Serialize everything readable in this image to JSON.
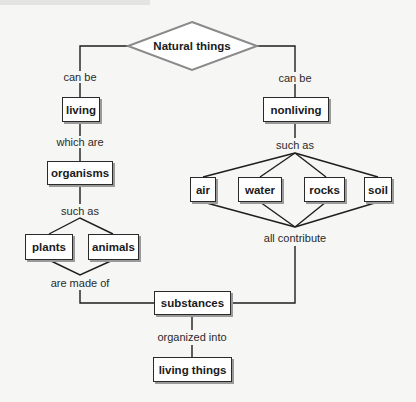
{
  "diagram": {
    "type": "concept-map",
    "root": {
      "label": "Natural things"
    },
    "nodes": {
      "living": "living",
      "nonliving": "nonliving",
      "organisms": "organisms",
      "plants": "plants",
      "animals": "animals",
      "air": "air",
      "water": "water",
      "rocks": "rocks",
      "soil": "soil",
      "substances": "substances",
      "living_things": "living things"
    },
    "links": {
      "root_living": "can be",
      "root_nonliving": "can be",
      "living_organisms": "which are",
      "organisms_examples": "such as",
      "organisms_substances": "are made of",
      "nonliving_examples": "such as",
      "examples_substances": "all contribute",
      "substances_living_things": "organized into"
    },
    "colors": {
      "background": "#f6f6f4",
      "box_border": "#2a2a2a",
      "box_shadow": "#9a9a9a",
      "diamond_stroke": "#8a8a8a",
      "line": "#1e1e1e"
    }
  }
}
